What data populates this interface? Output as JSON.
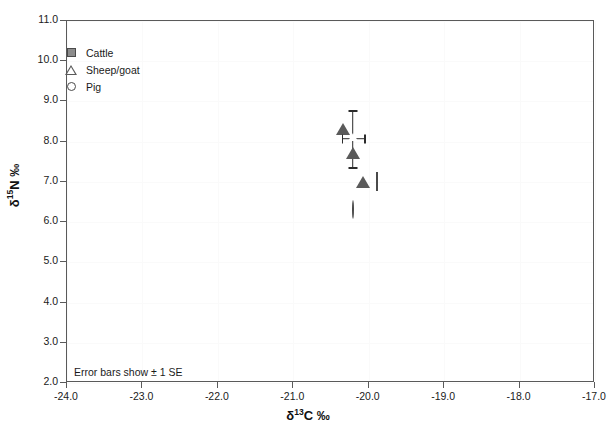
{
  "chart_data": {
    "type": "scatter",
    "title": "",
    "xlabel": "δ13C ‰",
    "ylabel": "δ15N ‰",
    "xlabel_parts": {
      "delta": "δ",
      "sup": "13",
      "element": "C ‰"
    },
    "ylabel_parts": {
      "delta": "δ",
      "sup": "15",
      "element": "N ‰"
    },
    "xlim": [
      -24.0,
      -17.0
    ],
    "ylim": [
      2.0,
      11.0
    ],
    "xticks": [
      "-24.0",
      "-23.0",
      "-22.0",
      "-21.0",
      "-20.0",
      "-19.0",
      "-18.0",
      "-17.0"
    ],
    "xtick_values": [
      -24.0,
      -23.0,
      -22.0,
      -21.0,
      -20.0,
      -19.0,
      -18.0,
      -17.0
    ],
    "yticks": [
      "11.0",
      "10.0",
      "9.0",
      "8.0",
      "7.0",
      "6.0",
      "5.0",
      "4.0",
      "3.0",
      "2.0"
    ],
    "ytick_values": [
      11.0,
      10.0,
      9.0,
      8.0,
      7.0,
      6.0,
      5.0,
      4.0,
      3.0,
      2.0
    ],
    "grid": "faint",
    "legend_position": "top-left-inside",
    "annotation": "Error bars show ± 1 SE",
    "series": [
      {
        "name": "Cattle",
        "marker": "filled-square",
        "color": "#8c8c8c",
        "points": [
          {
            "x": -19.89,
            "y": 6.99
          }
        ]
      },
      {
        "name": "Sheep/goat",
        "marker": "open-triangle",
        "color": "#5a5a5a",
        "points": [
          {
            "x": -20.34,
            "y": 8.66
          },
          {
            "x": -20.21,
            "y": 8.07,
            "xerr": 0.15,
            "yerr": 0.71
          },
          {
            "x": -20.08,
            "y": 7.35
          }
        ]
      },
      {
        "name": "Pig",
        "marker": "open-circle",
        "color": "#4a4a4a",
        "points": [
          {
            "x": -20.21,
            "y": 6.3
          }
        ]
      }
    ]
  },
  "legend": {
    "items": [
      {
        "label": "Cattle",
        "marker": "filled-square"
      },
      {
        "label": "Sheep/goat",
        "marker": "open-triangle"
      },
      {
        "label": "Pig",
        "marker": "open-circle"
      }
    ]
  }
}
